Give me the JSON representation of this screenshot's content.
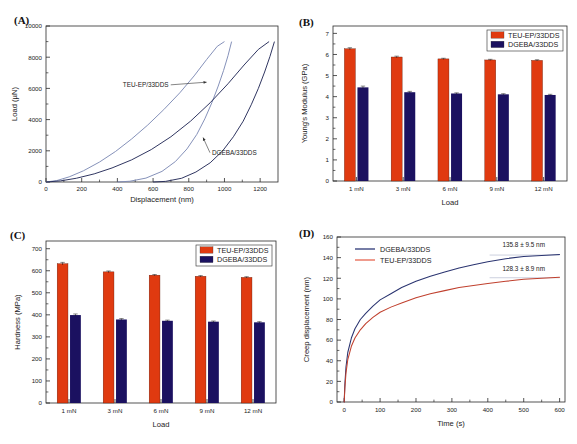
{
  "figure": {
    "panels": [
      "(A)",
      "(B)",
      "(C)",
      "(D)"
    ],
    "series_names": {
      "teu": "TEU-EP/33DDS",
      "dgeba": "DGEBA/33DDS"
    },
    "colors": {
      "red": "#E03A10",
      "navy": "#1B1160",
      "curve_light": "#7E8BB5",
      "curve_dark": "#252B58",
      "legend_line_navy": "#3B4580",
      "legend_line_red": "#E8705C",
      "axis": "#2a2a2a"
    }
  },
  "chart_data": [
    {
      "id": "A",
      "panel_tag": "(A)",
      "type": "line",
      "title": "",
      "xlabel": "Displacement (nm)",
      "ylabel": "Load (µN)",
      "xlim": [
        0,
        1300
      ],
      "ylim": [
        0,
        10000
      ],
      "xticks": [
        0,
        200,
        400,
        600,
        800,
        1000,
        1200
      ],
      "yticks": [
        0,
        2000,
        4000,
        6000,
        8000,
        10000
      ],
      "xtick_labels": [
        "0",
        "200",
        "400",
        "600",
        "800",
        "1000",
        "1200"
      ],
      "ytick_labels": [
        "0",
        "2000",
        "4000",
        "6000",
        "8000",
        "10000"
      ],
      "minor_ticks": true,
      "grid": false,
      "annotations": [
        {
          "text": "TEU-EP/33DDS",
          "x": 430,
          "y": 6100,
          "arrow_to_x": 900,
          "arrow_to_y": 6400
        },
        {
          "text": "DGEBA/33DDS",
          "x": 930,
          "y": 1750,
          "arrow_to_x": 880,
          "arrow_to_y": 2850
        }
      ],
      "series": [
        {
          "name": "TEU-EP/33DDS loading",
          "color": "#7E8BB5",
          "points": [
            [
              0,
              0
            ],
            [
              60,
              90
            ],
            [
              130,
              330
            ],
            [
              210,
              720
            ],
            [
              300,
              1280
            ],
            [
              390,
              1960
            ],
            [
              480,
              2760
            ],
            [
              570,
              3650
            ],
            [
              660,
              4640
            ],
            [
              750,
              5720
            ],
            [
              830,
              6800
            ],
            [
              900,
              7850
            ],
            [
              960,
              8700
            ],
            [
              1000,
              9000
            ]
          ]
        },
        {
          "name": "TEU-EP/33DDS unloading",
          "color": "#7E8BB5",
          "points": [
            [
              1040,
              9000
            ],
            [
              1020,
              8100
            ],
            [
              995,
              7150
            ],
            [
              965,
              6150
            ],
            [
              930,
              5100
            ],
            [
              890,
              4050
            ],
            [
              845,
              3050
            ],
            [
              790,
              2120
            ],
            [
              725,
              1310
            ],
            [
              650,
              680
            ],
            [
              560,
              250
            ],
            [
              470,
              50
            ],
            [
              400,
              0
            ]
          ]
        },
        {
          "name": "DGEBA/33DDS loading",
          "color": "#252B58",
          "points": [
            [
              0,
              0
            ],
            [
              80,
              70
            ],
            [
              170,
              240
            ],
            [
              270,
              520
            ],
            [
              370,
              900
            ],
            [
              480,
              1420
            ],
            [
              590,
              2080
            ],
            [
              700,
              2900
            ],
            [
              810,
              3900
            ],
            [
              920,
              5080
            ],
            [
              1020,
              6300
            ],
            [
              1110,
              7500
            ],
            [
              1190,
              8500
            ],
            [
              1250,
              9000
            ]
          ]
        },
        {
          "name": "DGEBA/33DDS unloading",
          "color": "#252B58",
          "points": [
            [
              1280,
              9000
            ],
            [
              1255,
              8050
            ],
            [
              1225,
              7050
            ],
            [
              1190,
              6000
            ],
            [
              1150,
              4950
            ],
            [
              1105,
              3900
            ],
            [
              1050,
              2900
            ],
            [
              990,
              2000
            ],
            [
              920,
              1230
            ],
            [
              840,
              640
            ],
            [
              760,
              240
            ],
            [
              670,
              40
            ],
            [
              600,
              0
            ]
          ]
        }
      ]
    },
    {
      "id": "B",
      "panel_tag": "(B)",
      "type": "bar",
      "title": "",
      "xlabel": "Load",
      "ylabel": "Young's Modulus (GPa)",
      "categories": [
        "1 mN",
        "3 mN",
        "6 mN",
        "9 mN",
        "12 mN"
      ],
      "ylim": [
        0,
        7.35
      ],
      "yticks": [
        0,
        1,
        2,
        3,
        4,
        5,
        6,
        7
      ],
      "ytick_labels": [
        "0",
        "1",
        "2",
        "3",
        "4",
        "5",
        "6",
        "7"
      ],
      "grid": false,
      "legend_position": "top-right",
      "legend": [
        "TEU-EP/33DDS",
        "DGEBA/33DDS"
      ],
      "series": [
        {
          "name": "TEU-EP/33DDS",
          "color": "#E03A10",
          "values": [
            6.27,
            5.88,
            5.79,
            5.74,
            5.72
          ],
          "errors": [
            0.05,
            0.04,
            0.03,
            0.03,
            0.03
          ]
        },
        {
          "name": "DGEBA/33DDS",
          "color": "#1B1160",
          "values": [
            4.44,
            4.21,
            4.15,
            4.11,
            4.08
          ],
          "errors": [
            0.06,
            0.04,
            0.03,
            0.03,
            0.03
          ]
        }
      ]
    },
    {
      "id": "C",
      "panel_tag": "(C)",
      "type": "bar",
      "title": "",
      "xlabel": "Load",
      "ylabel": "Hardness (MPa)",
      "categories": [
        "1 mN",
        "3 mN",
        "6 mN",
        "9 mN",
        "12 mN"
      ],
      "ylim": [
        0,
        735
      ],
      "yticks": [
        0,
        100,
        200,
        300,
        400,
        500,
        600,
        700
      ],
      "ytick_labels": [
        "0",
        "100",
        "200",
        "300",
        "400",
        "500",
        "600",
        "700"
      ],
      "grid": false,
      "legend_position": "top-right",
      "legend": [
        "TEU-EP/33DDS",
        "DGEBA/33DDS"
      ],
      "series": [
        {
          "name": "TEU-EP/33DDS",
          "color": "#E03A10",
          "values": [
            632,
            595,
            580,
            575,
            570
          ],
          "errors": [
            6,
            4,
            3,
            3,
            3
          ]
        },
        {
          "name": "DGEBA/33DDS",
          "color": "#1B1160",
          "values": [
            399,
            379,
            373,
            369,
            366
          ],
          "errors": [
            5,
            4,
            3,
            3,
            3
          ]
        }
      ]
    },
    {
      "id": "D",
      "panel_tag": "(D)",
      "type": "line",
      "title": "",
      "xlabel": "Time (s)",
      "ylabel": "Creep displacement (nm)",
      "xlim": [
        -20,
        615
      ],
      "ylim": [
        0,
        160
      ],
      "xticks": [
        0,
        100,
        200,
        300,
        400,
        500,
        600
      ],
      "yticks": [
        0,
        20,
        40,
        60,
        80,
        100,
        120,
        140,
        160
      ],
      "xtick_labels": [
        "0",
        "100",
        "200",
        "300",
        "400",
        "500",
        "600"
      ],
      "ytick_labels": [
        "0",
        "20",
        "40",
        "60",
        "80",
        "100",
        "120",
        "140",
        "160"
      ],
      "grid": false,
      "legend_position": "top-left",
      "legend": [
        "DGEBA/33DDS",
        "TEU-EP/33DDS"
      ],
      "annotations": [
        {
          "text": "135.8 ± 9.5 nm",
          "x": 500,
          "y": 150,
          "guide_y": 142.5,
          "guide_x0": 405,
          "guide_x1": 600
        },
        {
          "text": "128.3 ± 8.9 nm",
          "x": 500,
          "y": 127,
          "guide_y": 120.5,
          "guide_x0": 405,
          "guide_x1": 600
        }
      ],
      "series": [
        {
          "name": "DGEBA/33DDS",
          "color": "#2A3470",
          "points": [
            [
              0,
              0
            ],
            [
              2,
              18
            ],
            [
              5,
              34
            ],
            [
              10,
              48
            ],
            [
              20,
              62
            ],
            [
              30,
              71
            ],
            [
              45,
              80
            ],
            [
              60,
              86
            ],
            [
              80,
              93
            ],
            [
              100,
              99
            ],
            [
              130,
              105
            ],
            [
              160,
              111
            ],
            [
              200,
              117
            ],
            [
              240,
              122
            ],
            [
              280,
              126
            ],
            [
              320,
              130
            ],
            [
              360,
              133
            ],
            [
              400,
              136
            ],
            [
              450,
              139
            ],
            [
              500,
              141
            ],
            [
              550,
              142
            ],
            [
              600,
              143
            ]
          ]
        },
        {
          "name": "TEU-EP/33DDS",
          "color": "#C0402E",
          "points": [
            [
              0,
              0
            ],
            [
              2,
              14
            ],
            [
              5,
              28
            ],
            [
              10,
              41
            ],
            [
              20,
              54
            ],
            [
              30,
              62
            ],
            [
              45,
              70
            ],
            [
              60,
              76
            ],
            [
              80,
              82
            ],
            [
              100,
              87
            ],
            [
              130,
              92
            ],
            [
              160,
              96
            ],
            [
              200,
              101
            ],
            [
              240,
              105
            ],
            [
              280,
              108
            ],
            [
              320,
              111
            ],
            [
              360,
              113
            ],
            [
              400,
              115
            ],
            [
              450,
              117
            ],
            [
              500,
              119
            ],
            [
              550,
              120
            ],
            [
              600,
              121
            ]
          ]
        }
      ]
    }
  ]
}
